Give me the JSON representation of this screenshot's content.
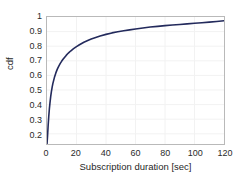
{
  "chart_data": {
    "type": "line",
    "title": "",
    "xlabel": "Subscription duration [sec]",
    "ylabel": "cdf",
    "xlim": [
      0,
      120
    ],
    "ylim": [
      0.13,
      1.0
    ],
    "xticks": [
      0,
      20,
      40,
      60,
      80,
      100,
      120
    ],
    "xtick_labels": [
      "0",
      "20",
      "40",
      "60",
      "80",
      "100",
      "120"
    ],
    "yticks": [
      0.2,
      0.3,
      0.4,
      0.5,
      0.6,
      0.7,
      0.8,
      0.9,
      1
    ],
    "ytick_labels": [
      "0.2",
      "0.3",
      "0.4",
      "0.5",
      "0.6",
      "0.7",
      "0.8",
      "0.9",
      "1"
    ],
    "grid": true,
    "grid_color": "#f2f2f2",
    "axis_color": "#b9b9b9",
    "legend": null,
    "series": [
      {
        "name": "cdf of subscription duration",
        "color": "#232a5c",
        "line_width": 1.6,
        "x": [
          0,
          0.4,
          0.8,
          1.2,
          1.6,
          2,
          2.5,
          3,
          3.5,
          4,
          5,
          6,
          7,
          8,
          9,
          10,
          11,
          12,
          13,
          14,
          15,
          16,
          18,
          20,
          22,
          25,
          28,
          30,
          33,
          36,
          40,
          44,
          48,
          52,
          56,
          60,
          65,
          70,
          75,
          80,
          85,
          90,
          95,
          100,
          105,
          110,
          115,
          120
        ],
        "y": [
          0.13,
          0.19,
          0.26,
          0.32,
          0.37,
          0.41,
          0.455,
          0.49,
          0.52,
          0.545,
          0.585,
          0.617,
          0.643,
          0.664,
          0.682,
          0.698,
          0.712,
          0.725,
          0.737,
          0.748,
          0.758,
          0.767,
          0.783,
          0.797,
          0.81,
          0.827,
          0.841,
          0.849,
          0.86,
          0.87,
          0.881,
          0.891,
          0.899,
          0.906,
          0.912,
          0.918,
          0.925,
          0.931,
          0.936,
          0.941,
          0.945,
          0.949,
          0.953,
          0.957,
          0.961,
          0.965,
          0.969,
          0.974
        ]
      }
    ]
  }
}
